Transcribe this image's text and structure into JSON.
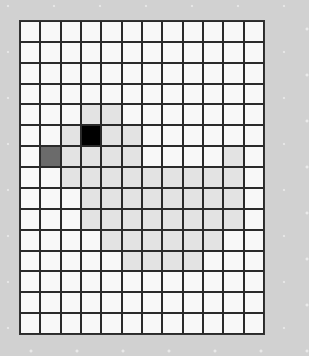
{
  "board": {
    "rows": 15,
    "cols": 12,
    "colors": {
      "empty": "#f8f8f8",
      "light": "#e3e3e3",
      "dark": "#6b6b6b",
      "black": "#000000",
      "background": "#d1d1d1",
      "grid_line": "#2a2a2a"
    },
    "cells": [
      "............",
      "............",
      "............",
      "............",
      "...LL.......",
      "..LBLL......",
      ".DLLLL....L.",
      "..LLLLLLLLL.",
      "...LLLLLLLL.",
      "...LLLLLLLL.",
      "....LLLLLL..",
      ".....LLLL...",
      "............",
      "............",
      "............"
    ]
  }
}
